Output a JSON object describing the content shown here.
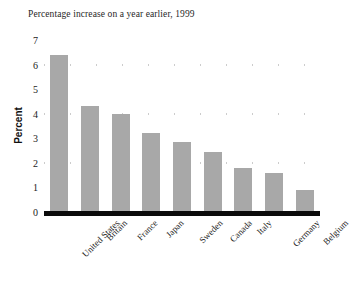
{
  "chart_data": {
    "type": "bar",
    "title": "Percentage increase on a year earlier, 1999",
    "xlabel": "",
    "ylabel": "Percent",
    "ylim": [
      0,
      7
    ],
    "yticks": [
      0,
      1,
      2,
      3,
      4,
      5,
      6,
      7
    ],
    "gridlines_at": [
      2,
      4,
      6
    ],
    "grid": true,
    "legend": "none",
    "categories": [
      "United States",
      "Britain",
      "France",
      "Japan",
      "Sweden",
      "Canada",
      "Italy",
      "Germany",
      "Belgium"
    ],
    "values": [
      6.4,
      4.3,
      4.0,
      3.2,
      2.85,
      2.45,
      1.8,
      1.6,
      0.9
    ],
    "bar_color": "#a8a8a8",
    "axis_color": "#0b0b0b",
    "gridline_color": "#9a9a9a",
    "background_color": "#ffffff"
  }
}
